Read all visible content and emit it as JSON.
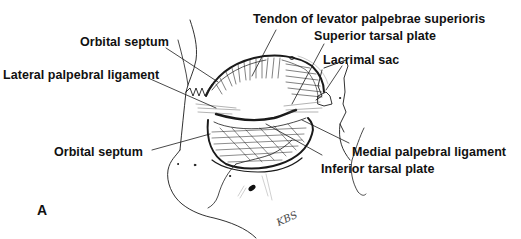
{
  "figure": {
    "panel_label": "A",
    "signature": "KBS",
    "top_fragment": "",
    "colors": {
      "ink": "#111111",
      "background": "#ffffff"
    },
    "labels": {
      "tendon_levator": "Tendon of levator palpebrae superioris",
      "superior_tarsal_plate": "Superior tarsal plate",
      "lacrimal_sac": "Lacrimal sac",
      "orbital_septum_upper": "Orbital septum",
      "lateral_palpebral_ligament": "Lateral palpebral ligament",
      "orbital_septum_lower": "Orbital septum",
      "medial_palpebral_ligament": "Medial palpebral ligament",
      "inferior_tarsal_plate": "Inferior tarsal plate"
    }
  }
}
